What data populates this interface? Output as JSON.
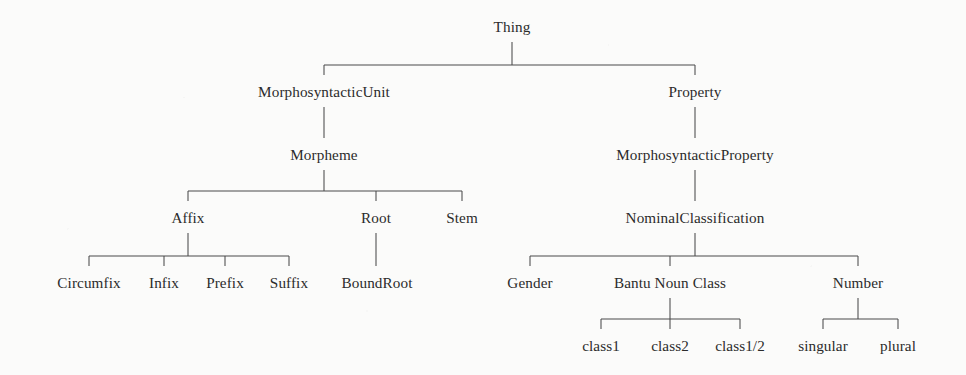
{
  "diagram": {
    "type": "taxonomy-tree",
    "title": "Thing",
    "orientation": "top-down",
    "colors": {
      "background": "#fbfbfa",
      "text": "#2b2b2b",
      "edge": "#4a4a4a"
    },
    "canvas": {
      "width": 966,
      "height": 375
    },
    "levels": [
      {
        "name": "root",
        "y": 32
      },
      {
        "name": "level-1",
        "y": 97
      },
      {
        "name": "level-2",
        "y": 160
      },
      {
        "name": "level-3",
        "y": 223
      },
      {
        "name": "level-4",
        "y": 288
      },
      {
        "name": "level-5",
        "y": 351
      }
    ],
    "nodes": [
      {
        "id": "thing",
        "label": "Thing",
        "x": 512,
        "y": 32,
        "depth": 0
      },
      {
        "id": "morphosyntactic-unit",
        "label": "MorphosyntacticUnit",
        "x": 324,
        "y": 97,
        "depth": 1
      },
      {
        "id": "property",
        "label": "Property",
        "x": 695,
        "y": 97,
        "depth": 1
      },
      {
        "id": "morpheme",
        "label": "Morpheme",
        "x": 324,
        "y": 160,
        "depth": 2
      },
      {
        "id": "morphosyntactic-property",
        "label": "MorphosyntacticProperty",
        "x": 695,
        "y": 160,
        "depth": 2
      },
      {
        "id": "affix",
        "label": "Affix",
        "x": 188,
        "y": 223,
        "depth": 3
      },
      {
        "id": "root-node",
        "label": "Root",
        "x": 376,
        "y": 223,
        "depth": 3
      },
      {
        "id": "stem",
        "label": "Stem",
        "x": 462,
        "y": 223,
        "depth": 3
      },
      {
        "id": "nominal-classification",
        "label": "NominalClassification",
        "x": 695,
        "y": 223,
        "depth": 3
      },
      {
        "id": "circumfix",
        "label": "Circumfix",
        "x": 89,
        "y": 288,
        "depth": 4
      },
      {
        "id": "infix",
        "label": "Infix",
        "x": 164,
        "y": 288,
        "depth": 4
      },
      {
        "id": "prefix",
        "label": "Prefix",
        "x": 225,
        "y": 288,
        "depth": 4
      },
      {
        "id": "suffix",
        "label": "Suffix",
        "x": 289,
        "y": 288,
        "depth": 4
      },
      {
        "id": "bound-root",
        "label": "BoundRoot",
        "x": 377,
        "y": 288,
        "depth": 4
      },
      {
        "id": "gender",
        "label": "Gender",
        "x": 530,
        "y": 288,
        "depth": 4
      },
      {
        "id": "bantu-noun-class",
        "label": "Bantu Noun Class",
        "x": 670,
        "y": 288,
        "depth": 4
      },
      {
        "id": "number",
        "label": "Number",
        "x": 858,
        "y": 288,
        "depth": 4
      },
      {
        "id": "class1",
        "label": "class1",
        "x": 601,
        "y": 351,
        "depth": 5
      },
      {
        "id": "class2",
        "label": "class2",
        "x": 670,
        "y": 351,
        "depth": 5
      },
      {
        "id": "class1-2",
        "label": "class1/2",
        "x": 740,
        "y": 351,
        "depth": 5
      },
      {
        "id": "singular",
        "label": "singular",
        "x": 823,
        "y": 351,
        "depth": 5
      },
      {
        "id": "plural",
        "label": "plural",
        "x": 898,
        "y": 351,
        "depth": 5
      }
    ],
    "edges": [
      {
        "parent": "thing",
        "children": [
          "morphosyntactic-unit",
          "property"
        ]
      },
      {
        "parent": "morphosyntactic-unit",
        "children": [
          "morpheme"
        ]
      },
      {
        "parent": "property",
        "children": [
          "morphosyntactic-property"
        ]
      },
      {
        "parent": "morpheme",
        "children": [
          "affix",
          "root-node",
          "stem"
        ]
      },
      {
        "parent": "morphosyntactic-property",
        "children": [
          "nominal-classification"
        ]
      },
      {
        "parent": "affix",
        "children": [
          "circumfix",
          "infix",
          "prefix",
          "suffix"
        ]
      },
      {
        "parent": "root-node",
        "children": [
          "bound-root"
        ]
      },
      {
        "parent": "nominal-classification",
        "children": [
          "gender",
          "bantu-noun-class",
          "number"
        ]
      },
      {
        "parent": "bantu-noun-class",
        "children": [
          "class1",
          "class2",
          "class1-2"
        ]
      },
      {
        "parent": "number",
        "children": [
          "singular",
          "plural"
        ]
      }
    ]
  }
}
